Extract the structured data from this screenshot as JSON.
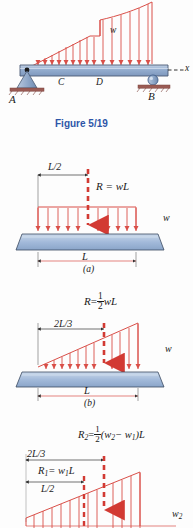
{
  "figure": {
    "caption": "Figure 5/19",
    "caption_color": "#2d56a8",
    "load_color": "#e0504a",
    "beam_fill": "#9fb6d4",
    "beam_edge": "#4a5a74",
    "ground_color": "#8a4a46"
  },
  "main_diagram": {
    "name": "beam-with-variable-distributed-load",
    "labels": {
      "support_a": "A",
      "support_b": "B",
      "point_c": "C",
      "point_d": "D",
      "load_intensity": "w",
      "axis_x": "x"
    },
    "supports": [
      {
        "id": "pin",
        "at": "A",
        "type": "pin-support"
      },
      {
        "id": "roller",
        "at": "B",
        "type": "roller-support"
      }
    ],
    "load_description": "distributed load rising linearly from A, constant over C-D region step, then increasing concave upward to B"
  },
  "case_a": {
    "label": "(a)",
    "name": "uniform-load-case",
    "resultant": "R = wL",
    "resultant_parts": {
      "symbol": "R",
      "equals": "=",
      "value": "wL"
    },
    "centroid_dim": "L/2",
    "span_dim": "L",
    "intensity": "w",
    "load_shape": "rectangular"
  },
  "case_b": {
    "label": "(b)",
    "name": "triangular-load-case",
    "resultant_symbol": "R",
    "resultant_equals": "=",
    "resultant_frac_num": "1",
    "resultant_frac_den": "2",
    "resultant_tail": "wL",
    "centroid_dim": "2L/3",
    "span_dim": "L",
    "intensity": "w",
    "load_shape": "triangular"
  },
  "case_c": {
    "label": "(c)",
    "name": "trapezoidal-load-case",
    "r2_symbol": "R",
    "r2_sub": "2",
    "r2_equals": "=",
    "r2_frac_num": "1",
    "r2_frac_den": "2",
    "r2_tail": "(w",
    "r2_tail_sub1": "2",
    "r2_minus": "− w",
    "r2_tail_sub2": "1",
    "r2_close": ")L",
    "r1_symbol": "R",
    "r1_sub": "1",
    "r1_equals": "= w",
    "r1_sub2": "1",
    "r1_tail": "L",
    "dim_2l3": "2L/3",
    "dim_l2": "L/2",
    "intensity_w2": "w",
    "intensity_w2_sub": "2",
    "load_shape": "trapezoidal"
  }
}
